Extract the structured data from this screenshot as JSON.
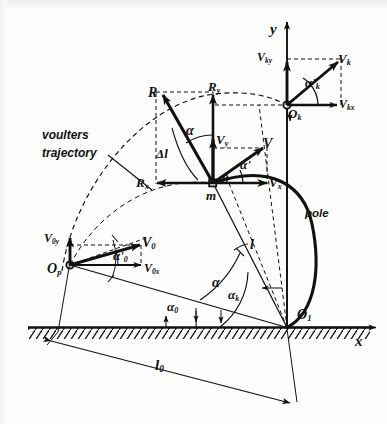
{
  "figure": {
    "kind": "mechanics-diagram",
    "background": "#fdfdfc",
    "ink": "#111111"
  },
  "axes": {
    "y_label": "y",
    "x_label": "x",
    "origin_label": "O",
    "origin_sub": "1"
  },
  "annotations": {
    "trajectory_line1": "voulters",
    "trajectory_line2": "trajectory",
    "pole": "pole"
  },
  "points": {
    "take_off": {
      "base": "O",
      "sub": "p"
    },
    "mass": "m",
    "mass_angle_mark": "0",
    "top": {
      "base": "O",
      "sub": "k"
    },
    "ground": {
      "base": "O",
      "sub": "1"
    }
  },
  "vectors": {
    "velocity": {
      "base": "V",
      "sub": ""
    },
    "velocity_x": {
      "base": "V",
      "sub": "x"
    },
    "velocity_y": {
      "base": "V",
      "sub": "y"
    },
    "velocity_initial": {
      "base": "V",
      "sub": "0"
    },
    "velocity_initial_x": {
      "base": "V",
      "sub": "0x"
    },
    "velocity_initial_y": {
      "base": "V",
      "sub": "0y"
    },
    "velocity_top": {
      "base": "V",
      "sub": "k"
    },
    "velocity_top_x": {
      "base": "V",
      "sub": "kx"
    },
    "velocity_top_y": {
      "base": "V",
      "sub": "ky"
    },
    "reaction": {
      "base": "R",
      "sub": ""
    },
    "reaction_x": {
      "base": "R",
      "sub": "x"
    },
    "reaction_y": {
      "base": "R",
      "sub": "y"
    }
  },
  "angles": {
    "alpha": "α",
    "alpha_prime": "α'",
    "alpha_k": {
      "base": "α",
      "sub": "k"
    },
    "alpha_k_prime": {
      "base": "α'",
      "sub": "k"
    },
    "alpha_0": {
      "base": "α",
      "sub": "0"
    },
    "alpha_0_prime": {
      "base": "α'",
      "sub": "0"
    }
  },
  "lengths": {
    "pole_length": "l",
    "pole_length_initial": {
      "base": "l",
      "sub": "0"
    },
    "delta_l": "Δl"
  }
}
